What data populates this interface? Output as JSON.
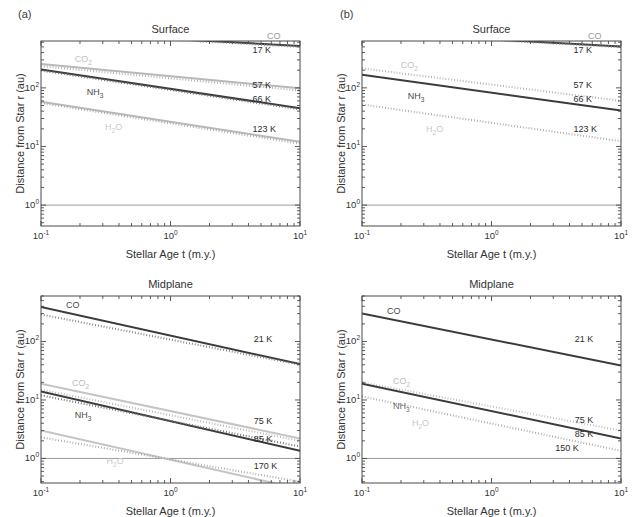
{
  "figure": {
    "panels": [
      {
        "tag": "(a)",
        "charts": [
          {
            "title": "Surface",
            "xlabel": "Stellar Age t (m.y.)",
            "ylabel": "Distance from Star r (au)",
            "xticks": [
              "10-1",
              "100",
              "101"
            ],
            "yticks": [
              "102",
              "101",
              "100"
            ]
          },
          {
            "title": "Midplane",
            "xlabel": "Stellar Age t (m.y.)",
            "ylabel": "Distance from Star r (au)",
            "xticks": [
              "10-1",
              "100",
              "101"
            ],
            "yticks": [
              "102",
              "101",
              "100"
            ]
          }
        ]
      },
      {
        "tag": "(b)",
        "charts": [
          {
            "title": "Surface",
            "xlabel": "Stellar Age t (m.y.)",
            "ylabel": "Distance from Star r (au)",
            "xticks": [
              "10-1",
              "100",
              "101"
            ],
            "yticks": [
              "102",
              "101",
              "100"
            ]
          },
          {
            "title": "Midplane",
            "xlabel": "Stellar Age t (m.y.)",
            "ylabel": "Distance from Star r (au)",
            "xticks": [
              "10-1",
              "100",
              "101"
            ],
            "yticks": [
              "102",
              "101",
              "100"
            ]
          }
        ]
      }
    ]
  },
  "colors": {
    "dark": "#3b3b3b",
    "mid": "#8a8a8a",
    "light": "#c2c2c2",
    "axis": "#4a4a4a",
    "unity_line": "#8f8f8f",
    "text": "#2d2d2d"
  },
  "chart_data": [
    {
      "id": "a-surface",
      "type": "line",
      "title": "Surface",
      "panel": "(a)",
      "xlabel": "Stellar Age t (m.y.)",
      "ylabel": "Distance from Star r (au)",
      "xscale": "log",
      "yscale": "log",
      "xlim": [
        0.1,
        10
      ],
      "ylim": [
        0.44,
        630
      ],
      "xticks": [
        0.1,
        1,
        10
      ],
      "xticklabels": [
        "10⁻¹",
        "10⁰",
        "10¹"
      ],
      "yticks": [
        1,
        10,
        100
      ],
      "yticklabels": [
        "10⁰",
        "10¹",
        "10²"
      ],
      "grid": false,
      "legend": "inline-annotations",
      "annotations": [
        {
          "text": "CO",
          "x": 6.4,
          "color": "#9a9a9a"
        },
        {
          "text": "CO2",
          "x": 0.21,
          "color": "#c2c2c2"
        },
        {
          "text": "NH3",
          "x": 0.26,
          "color": "#4a4a4a"
        },
        {
          "text": "H2O",
          "x": 0.36,
          "color": "#c9c9c9"
        }
      ],
      "temperature_labels": [
        {
          "text": "17 K",
          "x": 4.3,
          "y": 430
        },
        {
          "text": "57 K",
          "x": 4.3,
          "y": 108
        },
        {
          "text": "66 K",
          "x": 4.3,
          "y": 62
        },
        {
          "text": "123 K",
          "x": 4.3,
          "y": 19
        }
      ],
      "series": [
        {
          "name": "CO solid",
          "style": "solid",
          "color": "#3b3b3b",
          "points": [
            [
              0.1,
              900
            ],
            [
              10,
              520
            ]
          ]
        },
        {
          "name": "CO dotted",
          "style": "dotted",
          "color": "#8a8a8a",
          "points": [
            [
              0.1,
              880
            ],
            [
              10,
              500
            ]
          ]
        },
        {
          "name": "CO2 solid",
          "style": "solid",
          "color": "#b8b8b8",
          "points": [
            [
              0.1,
              255
            ],
            [
              10,
              98
            ]
          ]
        },
        {
          "name": "CO2 dotted",
          "style": "dotted",
          "color": "#aaaaaa",
          "points": [
            [
              0.1,
              235
            ],
            [
              10,
              90
            ]
          ]
        },
        {
          "name": "NH3 solid",
          "style": "solid",
          "color": "#3b3b3b",
          "points": [
            [
              0.1,
              205
            ],
            [
              10,
              45
            ]
          ]
        },
        {
          "name": "NH3 dotted",
          "style": "dotted",
          "color": "#6f6f6f",
          "points": [
            [
              0.1,
              197
            ],
            [
              10,
              43
            ]
          ]
        },
        {
          "name": "H2O solid",
          "style": "solid",
          "color": "#b8b8b8",
          "points": [
            [
              0.1,
              58
            ],
            [
              10,
              12
            ]
          ]
        },
        {
          "name": "H2O dotted",
          "style": "dotted",
          "color": "#a5a5a5",
          "points": [
            [
              0.1,
              55
            ],
            [
              10,
              11.2
            ]
          ]
        }
      ],
      "reference_line": {
        "y": 1,
        "color": "#8f8f8f"
      }
    },
    {
      "id": "b-surface",
      "type": "line",
      "title": "Surface",
      "panel": "(b)",
      "xlabel": "Stellar Age t (m.y.)",
      "ylabel": "Distance from Star r (au)",
      "xscale": "log",
      "yscale": "log",
      "xlim": [
        0.1,
        10
      ],
      "ylim": [
        0.44,
        630
      ],
      "xticks": [
        0.1,
        1,
        10
      ],
      "xticklabels": [
        "10⁻¹",
        "10⁰",
        "10¹"
      ],
      "yticks": [
        1,
        10,
        100
      ],
      "yticklabels": [
        "10⁰",
        "10¹",
        "10²"
      ],
      "grid": false,
      "annotations": [
        {
          "text": "CO",
          "x": 6.4,
          "color": "#9a9a9a"
        },
        {
          "text": "CO2",
          "x": 0.23,
          "color": "#c2c2c2"
        },
        {
          "text": "NH3",
          "x": 0.26,
          "color": "#4a4a4a"
        },
        {
          "text": "H2O",
          "x": 0.36,
          "color": "#c9c9c9"
        }
      ],
      "temperature_labels": [
        {
          "text": "17 K",
          "x": 4.3,
          "y": 430
        },
        {
          "text": "57 K",
          "x": 4.3,
          "y": 108
        },
        {
          "text": "66 K",
          "x": 4.3,
          "y": 62
        },
        {
          "text": "123 K",
          "x": 4.3,
          "y": 19
        }
      ],
      "series": [
        {
          "name": "CO solid",
          "style": "solid",
          "color": "#3b3b3b",
          "points": [
            [
              0.1,
              880
            ],
            [
              10,
              510
            ]
          ]
        },
        {
          "name": "CO dotted",
          "style": "dotted",
          "color": "#8a8a8a",
          "points": [
            [
              0.1,
              860
            ],
            [
              10,
              495
            ]
          ]
        },
        {
          "name": "CO2 dotted",
          "style": "dotted",
          "color": "#b0b0b0",
          "points": [
            [
              0.1,
              215
            ],
            [
              10,
              60
            ]
          ]
        },
        {
          "name": "NH3 solid",
          "style": "solid",
          "color": "#3b3b3b",
          "points": [
            [
              0.1,
              168
            ],
            [
              10,
              41
            ]
          ]
        },
        {
          "name": "H2O dotted",
          "style": "dotted",
          "color": "#a8a8a8",
          "points": [
            [
              0.1,
              52
            ],
            [
              10,
              12.3
            ]
          ]
        }
      ],
      "reference_line": {
        "y": 1,
        "color": "#8f8f8f"
      }
    },
    {
      "id": "a-midplane",
      "type": "line",
      "title": "Midplane",
      "panel": "(a)",
      "xlabel": "Stellar Age t (m.y.)",
      "ylabel": "Distance from Star r (au)",
      "xscale": "log",
      "yscale": "log",
      "xlim": [
        0.1,
        10
      ],
      "ylim": [
        0.38,
        600
      ],
      "xticks": [
        0.1,
        1,
        10
      ],
      "xticklabels": [
        "10⁻¹",
        "10⁰",
        "10¹"
      ],
      "yticks": [
        1,
        10,
        100
      ],
      "yticklabels": [
        "10⁰",
        "10¹",
        "10²"
      ],
      "grid": false,
      "annotations": [
        {
          "text": "CO",
          "x": 0.18,
          "color": "#4a4a4a"
        },
        {
          "text": "CO2",
          "x": 0.2,
          "color": "#bcbcbc"
        },
        {
          "text": "NH3",
          "x": 0.21,
          "color": "#4a4a4a"
        },
        {
          "text": "H2O",
          "x": 0.37,
          "color": "#c9c9c9"
        }
      ],
      "temperature_labels": [
        {
          "text": "21 K",
          "x": 4.4,
          "y": 105
        },
        {
          "text": "75 K",
          "x": 4.4,
          "y": 4.2
        },
        {
          "text": "85 K",
          "x": 4.4,
          "y": 2.1
        },
        {
          "text": "170 K",
          "x": 4.4,
          "y": 0.72
        }
      ],
      "series": [
        {
          "name": "CO solid",
          "style": "solid",
          "color": "#3b3b3b",
          "points": [
            [
              0.1,
              390
            ],
            [
              10,
              41
            ]
          ]
        },
        {
          "name": "CO dotted",
          "style": "dotted",
          "color": "#7d7d7d",
          "points": [
            [
              0.1,
              290
            ],
            [
              10,
              40
            ]
          ]
        },
        {
          "name": "CO2 solid",
          "style": "solid",
          "color": "#c4c4c4",
          "points": [
            [
              0.1,
              19
            ],
            [
              10,
              2.2
            ]
          ]
        },
        {
          "name": "CO2 dotted",
          "style": "dotted",
          "color": "#b4b4b4",
          "points": [
            [
              0.1,
              15
            ],
            [
              10,
              2.0
            ]
          ]
        },
        {
          "name": "NH3 solid",
          "style": "solid",
          "color": "#3b3b3b",
          "points": [
            [
              0.1,
              14
            ],
            [
              10,
              1.35
            ]
          ]
        },
        {
          "name": "NH3 dotted",
          "style": "dotted",
          "color": "#6f6f6f",
          "points": [
            [
              0.1,
              12
            ],
            [
              10,
              1.6
            ]
          ]
        },
        {
          "name": "H2O solid",
          "style": "solid",
          "color": "#c4c4c4",
          "points": [
            [
              0.1,
              3.0
            ],
            [
              10,
              0.3
            ]
          ]
        },
        {
          "name": "H2O dotted",
          "style": "dotted",
          "color": "#a8a8a8",
          "points": [
            [
              0.1,
              2.3
            ],
            [
              10,
              0.4
            ]
          ]
        }
      ],
      "reference_line": {
        "y": 1,
        "color": "#8f8f8f"
      }
    },
    {
      "id": "b-midplane",
      "type": "line",
      "title": "Midplane",
      "panel": "(b)",
      "xlabel": "Stellar Age t (m.y.)",
      "ylabel": "Distance from Star r (au)",
      "xscale": "log",
      "yscale": "log",
      "xlim": [
        0.1,
        10
      ],
      "ylim": [
        0.38,
        600
      ],
      "xticks": [
        0.1,
        1,
        10
      ],
      "xticklabels": [
        "10⁻¹",
        "10⁰",
        "10¹"
      ],
      "yticks": [
        1,
        10,
        100
      ],
      "yticklabels": [
        "10⁰",
        "10¹",
        "10²"
      ],
      "grid": false,
      "annotations": [
        {
          "text": "CO",
          "x": 0.18,
          "color": "#4a4a4a"
        },
        {
          "text": "CO2",
          "x": 0.2,
          "color": "#bcbcbc"
        },
        {
          "text": "NH3",
          "x": 0.2,
          "color": "#6a6a6a"
        },
        {
          "text": "H2O",
          "x": 0.28,
          "color": "#c9c9c9"
        }
      ],
      "temperature_labels": [
        {
          "text": "21 K",
          "x": 4.4,
          "y": 105
        },
        {
          "text": "75 K",
          "x": 4.4,
          "y": 4.3
        },
        {
          "text": "85 K",
          "x": 4.4,
          "y": 2.5
        },
        {
          "text": "150 K",
          "x": 3.1,
          "y": 1.45
        }
      ],
      "series": [
        {
          "name": "CO solid",
          "style": "solid",
          "color": "#3b3b3b",
          "points": [
            [
              0.1,
              300
            ],
            [
              10,
              39
            ]
          ]
        },
        {
          "name": "CO2 dotted",
          "style": "dotted",
          "color": "#bcbcbc",
          "points": [
            [
              0.1,
              20
            ],
            [
              10,
              3.0
            ]
          ]
        },
        {
          "name": "NH3 solid",
          "style": "solid",
          "color": "#3b3b3b",
          "points": [
            [
              0.1,
              19
            ],
            [
              10,
              2.2
            ]
          ]
        },
        {
          "name": "H2O dotted",
          "style": "dotted",
          "color": "#a8a8a8",
          "points": [
            [
              0.1,
              11.5
            ],
            [
              10,
              1.35
            ]
          ]
        }
      ],
      "reference_line": {
        "y": 1,
        "color": "#8f8f8f"
      }
    }
  ]
}
